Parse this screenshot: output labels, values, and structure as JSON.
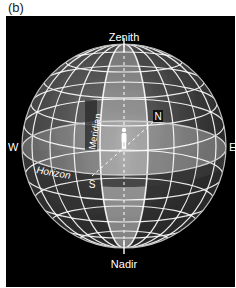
{
  "figure": {
    "panel_label": "(b)",
    "colors": {
      "background": "#000000",
      "grid_lines": "#ffffff",
      "sphere_upper": "#4a4a4a",
      "sphere_lower": "#3a3a3a",
      "meridian_band": "#9a9a9a",
      "horizon_plane": "#8c8c8c"
    },
    "labels": {
      "zenith": "Zenith",
      "nadir": "Nadir",
      "west": "W",
      "east": "E",
      "north": "N",
      "south": "S",
      "meridian": "Meridian",
      "horizon": "Horizon"
    },
    "observer": "standing-person-icon"
  }
}
